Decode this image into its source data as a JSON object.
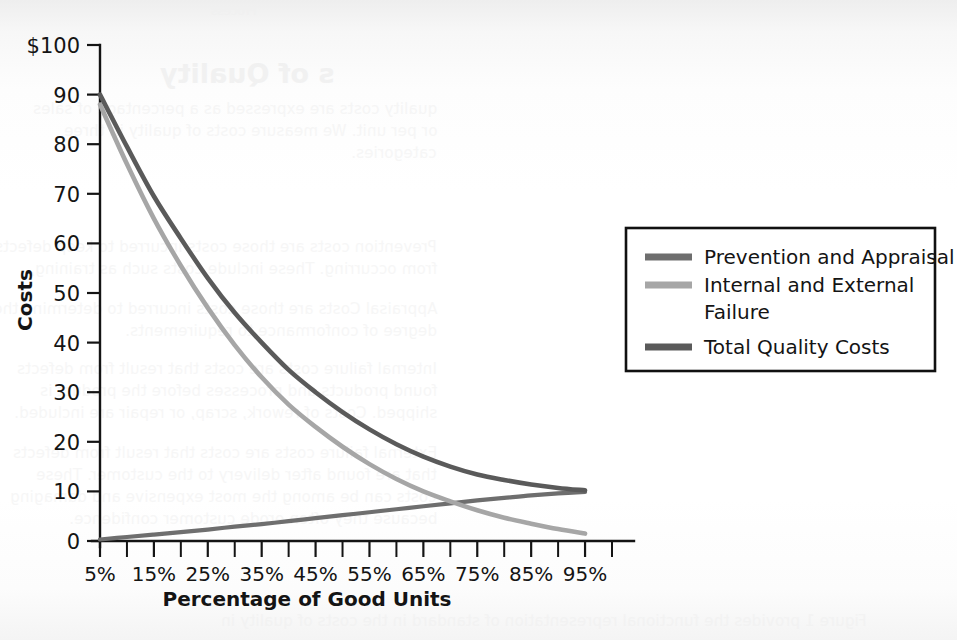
{
  "figure": {
    "background_note": "scanned textbook page with faint mirrored bleed-through",
    "plot_bg": "#ffffff",
    "axis_color": "#141414"
  },
  "bleed_through": {
    "heading": "s of Quality",
    "top_small": "Process",
    "lines": [
      "quality costs are expressed as a percentage of sales",
      "or per unit. We measure costs of quality in three",
      "categories.",
      "Prevention costs are those costs incurred to keep defects",
      "from occurring. These include costs such as training,",
      "Appraisal Costs are those costs incurred to determine the",
      "degree of conformance to requirements.",
      "Internal failure costs are costs that result from defects",
      "found products and processes before the product is",
      "shipped. Costs of rework, scrap, or repair are included.",
      "External failure costs are costs that result from defects",
      "that are found after delivery to the customer. These",
      "costs can be among the most expensive and damaging",
      "because they often erode customer confidence."
    ],
    "caption": "Figure 1 provides the functional representation of standard in the costs of quality in"
  },
  "chart_data": {
    "type": "line",
    "title": "",
    "xlabel": "Percentage of Good Units",
    "ylabel": "Costs",
    "y_axis_top_label": "$100",
    "xlim": [
      5,
      100
    ],
    "ylim": [
      0,
      100
    ],
    "grid": false,
    "legend_position": "right",
    "x_tick_labels": [
      "5%",
      "15%",
      "25%",
      "35%",
      "45%",
      "55%",
      "65%",
      "75%",
      "85%",
      "95%"
    ],
    "x_tick_values": [
      5,
      15,
      25,
      35,
      45,
      55,
      65,
      75,
      85,
      95
    ],
    "x_minor_tick_values": [
      10,
      20,
      30,
      40,
      50,
      60,
      70,
      80,
      90,
      100
    ],
    "y_tick_labels": [
      "0",
      "10",
      "20",
      "30",
      "40",
      "50",
      "60",
      "70",
      "80",
      "90",
      "$100"
    ],
    "y_tick_values": [
      0,
      10,
      20,
      30,
      40,
      50,
      60,
      70,
      80,
      90,
      100
    ],
    "x": [
      5,
      10,
      15,
      20,
      25,
      30,
      35,
      40,
      45,
      50,
      55,
      60,
      65,
      70,
      75,
      80,
      85,
      90,
      95
    ],
    "series": [
      {
        "name": "Prevention and Appraisal",
        "color": "#6e6e6e",
        "width": 4.2,
        "values": [
          0.3,
          0.8,
          1.3,
          1.8,
          2.3,
          2.9,
          3.4,
          4.0,
          4.6,
          5.2,
          5.8,
          6.4,
          7.0,
          7.6,
          8.2,
          8.7,
          9.2,
          9.6,
          9.9
        ]
      },
      {
        "name": "Internal and External Failure",
        "color": "#a6a6a6",
        "width": 4.6,
        "values": [
          88.0,
          76.0,
          65.0,
          55.5,
          47.0,
          39.5,
          33.0,
          27.5,
          23.0,
          19.0,
          15.5,
          12.5,
          10.0,
          8.0,
          6.2,
          4.7,
          3.5,
          2.4,
          1.5
        ]
      },
      {
        "name": "Total Quality Costs",
        "color": "#5a5a5a",
        "width": 4.6,
        "values": [
          90.0,
          79.5,
          69.5,
          61.0,
          53.0,
          46.0,
          40.0,
          34.5,
          30.0,
          26.0,
          22.5,
          19.5,
          17.0,
          15.0,
          13.4,
          12.3,
          11.4,
          10.7,
          10.2
        ]
      }
    ],
    "legend_entries": [
      {
        "label": "Prevention and Appraisal",
        "color": "#6e6e6e"
      },
      {
        "label": "Internal and External",
        "label2": "Failure",
        "color": "#a6a6a6"
      },
      {
        "label": "Total Quality Costs",
        "color": "#5a5a5a"
      }
    ]
  }
}
